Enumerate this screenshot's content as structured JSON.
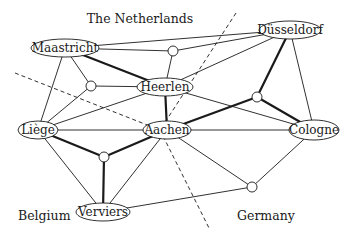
{
  "regions": [
    {
      "id": "netherlands",
      "label": "The Netherlands",
      "x": 140,
      "y": 23
    },
    {
      "id": "belgium",
      "label": "Belgium",
      "x": 18,
      "y": 220
    },
    {
      "id": "germany",
      "label": "Germany",
      "x": 237,
      "y": 220
    }
  ],
  "borders": [
    {
      "id": "border-nl-be",
      "x1": 15,
      "y1": 73,
      "x2": 160,
      "y2": 130
    },
    {
      "id": "border-nl-de",
      "x1": 236,
      "y1": 13,
      "x2": 160,
      "y2": 130
    },
    {
      "id": "border-be-de",
      "x1": 160,
      "y1": 130,
      "x2": 210,
      "y2": 230
    }
  ],
  "nodes": [
    {
      "id": "maastricht",
      "label": "Maastricht",
      "type": "city",
      "x": 65,
      "y": 48,
      "rx": 34,
      "ry": 9
    },
    {
      "id": "dusseldorf",
      "label": "Düsseldorf",
      "type": "city",
      "x": 290,
      "y": 30,
      "rx": 31,
      "ry": 9
    },
    {
      "id": "heerlen",
      "label": "Heerlen",
      "type": "city",
      "x": 165,
      "y": 87,
      "rx": 28,
      "ry": 9
    },
    {
      "id": "liege",
      "label": "Liège",
      "type": "city",
      "x": 38,
      "y": 130,
      "rx": 20,
      "ry": 9
    },
    {
      "id": "aachen",
      "label": "Aachen",
      "type": "city",
      "x": 167,
      "y": 130,
      "rx": 24,
      "ry": 9
    },
    {
      "id": "cologne",
      "label": "Cologne",
      "type": "city",
      "x": 314,
      "y": 130,
      "rx": 25,
      "ry": 10
    },
    {
      "id": "verviers",
      "label": "Verviers",
      "type": "city",
      "x": 103,
      "y": 212,
      "rx": 27,
      "ry": 9
    },
    {
      "id": "c1",
      "label": "",
      "type": "junction",
      "x": 173,
      "y": 51,
      "r": 5
    },
    {
      "id": "c2",
      "label": "",
      "type": "junction",
      "x": 91,
      "y": 86,
      "r": 5
    },
    {
      "id": "c3",
      "label": "",
      "type": "junction",
      "x": 257,
      "y": 97,
      "r": 5
    },
    {
      "id": "c4",
      "label": "",
      "type": "junction",
      "x": 104,
      "y": 157,
      "r": 5
    },
    {
      "id": "c5",
      "label": "",
      "type": "junction",
      "x": 252,
      "y": 187,
      "r": 5
    }
  ],
  "edges": [
    {
      "from": "maastricht",
      "to": "dusseldorf",
      "thick": false
    },
    {
      "from": "maastricht",
      "to": "c1",
      "thick": false
    },
    {
      "from": "c1",
      "to": "dusseldorf",
      "thick": false
    },
    {
      "from": "c1",
      "to": "heerlen",
      "thick": false
    },
    {
      "from": "heerlen",
      "to": "dusseldorf",
      "thick": false
    },
    {
      "from": "maastricht",
      "to": "heerlen",
      "thick": true
    },
    {
      "from": "maastricht",
      "to": "c2",
      "thick": false
    },
    {
      "from": "maastricht",
      "to": "liege",
      "thick": false
    },
    {
      "from": "c2",
      "to": "heerlen",
      "thick": false
    },
    {
      "from": "c2",
      "to": "liege",
      "thick": false
    },
    {
      "from": "liege",
      "to": "heerlen",
      "thick": false
    },
    {
      "from": "liege",
      "to": "aachen",
      "thick": false
    },
    {
      "from": "liege",
      "to": "c4",
      "thick": true
    },
    {
      "from": "liege",
      "to": "verviers",
      "thick": false
    },
    {
      "from": "heerlen",
      "to": "aachen",
      "thick": true
    },
    {
      "from": "heerlen",
      "to": "cologne",
      "thick": false
    },
    {
      "from": "aachen",
      "to": "c4",
      "thick": true
    },
    {
      "from": "aachen",
      "to": "verviers",
      "thick": false
    },
    {
      "from": "aachen",
      "to": "c3",
      "thick": true
    },
    {
      "from": "aachen",
      "to": "cologne",
      "thick": false
    },
    {
      "from": "aachen",
      "to": "c5",
      "thick": false
    },
    {
      "from": "c4",
      "to": "verviers",
      "thick": true
    },
    {
      "from": "c3",
      "to": "dusseldorf",
      "thick": true
    },
    {
      "from": "c3",
      "to": "cologne",
      "thick": true
    },
    {
      "from": "dusseldorf",
      "to": "cologne",
      "thick": false
    },
    {
      "from": "cologne",
      "to": "c5",
      "thick": false
    },
    {
      "from": "verviers",
      "to": "c5",
      "thick": false
    }
  ],
  "style": {
    "stroke": "#1a1a1a",
    "thin_width": 0.9,
    "thick_width": 2.2,
    "fill": "#ffffff"
  }
}
